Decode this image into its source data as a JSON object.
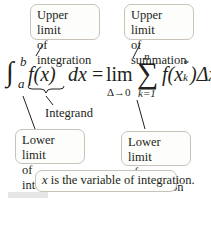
{
  "labels": {
    "upper_integration": [
      "Upper limit",
      "of integration"
    ],
    "upper_summation": [
      "Upper limit",
      "of summation"
    ],
    "lower_integration": [
      "Lower limit",
      "of integration"
    ],
    "lower_summation": [
      "Lower limit",
      "of summation"
    ],
    "integrand": "Integrand",
    "variable_note_var": "x",
    "variable_note_rest": " is the variable of integration."
  },
  "formula": {
    "integral_sign": "∫",
    "upper": "b",
    "lower": "a",
    "integrand": "f(x)",
    "dx": "dx",
    "equals": "=",
    "lim": "lim",
    "lim_sub": "Δ→0",
    "sigma": "∑",
    "sum_upper": "n",
    "sum_lower": "k=1",
    "summand_f": "f(x",
    "summand_sub": "k",
    "summand_sup": "*",
    "summand_close": ")",
    "delta": "Δx",
    "delta_sub": "k"
  },
  "colors": {
    "box_border": "#c8c2b8",
    "text": "#231f20",
    "line": "#231f20"
  }
}
